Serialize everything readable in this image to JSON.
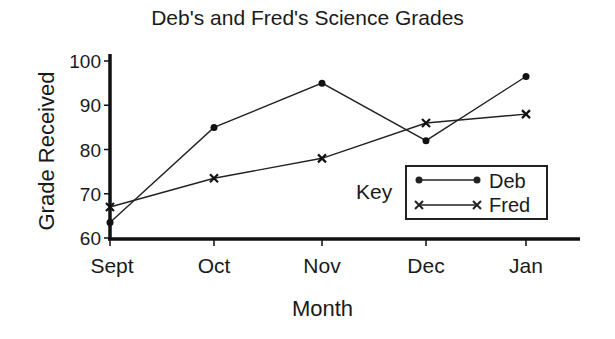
{
  "chart_data": {
    "type": "line",
    "title": "Deb's and Fred's Science Grades",
    "xlabel": "Month",
    "ylabel": "Grade Received",
    "categories": [
      "Sept",
      "Oct",
      "Nov",
      "Dec",
      "Jan"
    ],
    "series": [
      {
        "name": "Deb",
        "marker": "dot",
        "values": [
          63.5,
          85,
          95,
          82,
          96.5
        ]
      },
      {
        "name": "Fred",
        "marker": "x",
        "values": [
          67,
          73.5,
          78,
          86,
          88
        ]
      }
    ],
    "yticks": [
      60,
      70,
      80,
      90,
      100
    ],
    "ylim": [
      60,
      100
    ],
    "grid": false,
    "legend": {
      "title": "Key",
      "position": "lower right",
      "entries": [
        "Deb",
        "Fred"
      ]
    }
  },
  "labels": {
    "title": "Deb's and Fred's Science Grades",
    "xlabel": "Month",
    "ylabel": "Grade Received",
    "key": "Key",
    "legend_deb": "Deb",
    "legend_fred": "Fred",
    "yt0": "60",
    "yt1": "70",
    "yt2": "80",
    "yt3": "90",
    "yt4": "100",
    "xt0": "Sept",
    "xt1": "Oct",
    "xt2": "Nov",
    "xt3": "Dec",
    "xt4": "Jan"
  },
  "colors": {
    "line": "#222222",
    "background": "#ffffff"
  }
}
